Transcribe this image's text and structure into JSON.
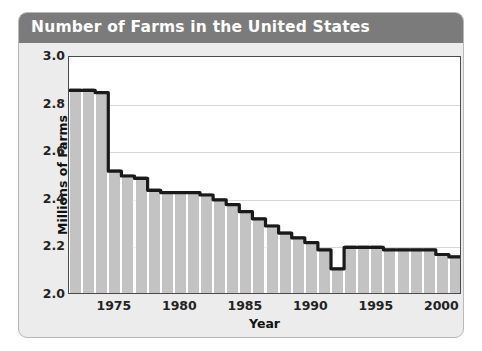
{
  "figure": {
    "title": "Number of Farms in the United States",
    "title_bar_color": "#7b7b7b",
    "panel_color": "#ececec",
    "plot_background": "#ffffff",
    "bar_color": "#c3c3c3",
    "line_color": "#1a1a1a",
    "gridline_color": "#d8d8d8"
  },
  "chart_data": {
    "type": "bar",
    "title": "Number of Farms in the United States",
    "xlabel": "Year",
    "ylabel": "Millions of Farms",
    "ylim": [
      2.0,
      3.0
    ],
    "xlim": [
      1971.5,
      2001.5
    ],
    "ytick_labels": [
      "3.0",
      "2.8",
      "2.6",
      "2.4",
      "2.2",
      "2.0"
    ],
    "yticks": [
      3.0,
      2.8,
      2.6,
      2.4,
      2.2,
      2.0
    ],
    "xtick_labels": [
      "1975",
      "1980",
      "1985",
      "1990",
      "1995",
      "2000"
    ],
    "xticks": [
      1975,
      1980,
      1985,
      1990,
      1995,
      2000
    ],
    "grid": "horizontal",
    "legend": "none",
    "overlay_line": true,
    "units": "millions",
    "categories": [
      1972,
      1973,
      1974,
      1975,
      1976,
      1977,
      1978,
      1979,
      1980,
      1981,
      1982,
      1983,
      1984,
      1985,
      1986,
      1987,
      1988,
      1989,
      1990,
      1991,
      1992,
      1993,
      1994,
      1995,
      1996,
      1997,
      1998,
      1999,
      2000,
      2001
    ],
    "values": [
      2.86,
      2.86,
      2.85,
      2.52,
      2.5,
      2.49,
      2.44,
      2.43,
      2.43,
      2.43,
      2.42,
      2.4,
      2.38,
      2.35,
      2.32,
      2.29,
      2.26,
      2.24,
      2.22,
      2.19,
      2.11,
      2.2,
      2.2,
      2.2,
      2.19,
      2.19,
      2.19,
      2.19,
      2.17,
      2.16
    ]
  }
}
